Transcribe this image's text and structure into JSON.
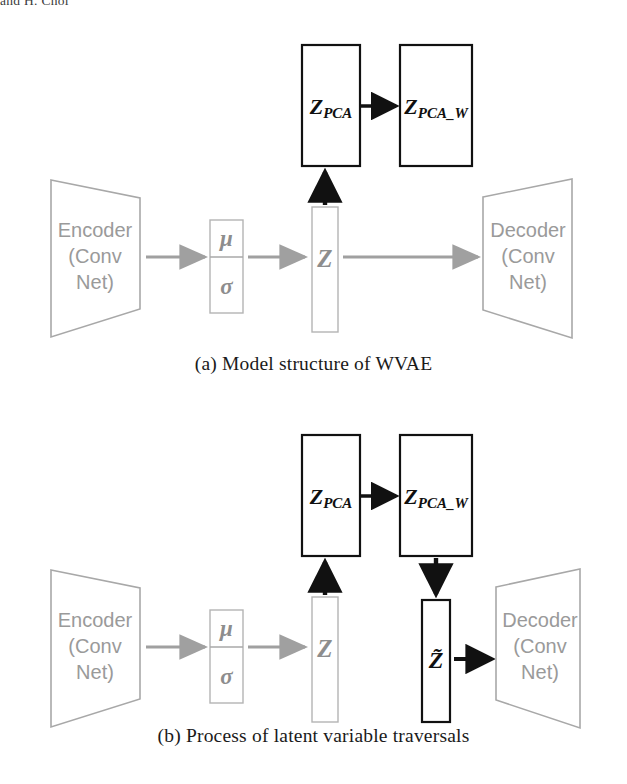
{
  "page": {
    "running_header": "and H. Choi"
  },
  "figures": [
    {
      "id": "fig-a",
      "caption": "(a) Model structure of WVAE",
      "nodes": {
        "encoder_line1": "Encoder",
        "encoder_line2": "(Conv",
        "encoder_line3": "Net)",
        "mu": "μ",
        "sigma": "σ",
        "z": "Z",
        "z_pca_main": "Z",
        "z_pca_sub": "PCA",
        "z_pca_w_main": "Z",
        "z_pca_w_sub": "PCA_W",
        "decoder_line1": "Decoder",
        "decoder_line2": "(Conv",
        "decoder_line3": "Net)"
      }
    },
    {
      "id": "fig-b",
      "caption": "(b) Process of latent variable traversals",
      "nodes": {
        "encoder_line1": "Encoder",
        "encoder_line2": "(Conv",
        "encoder_line3": "Net)",
        "mu": "μ",
        "sigma": "σ",
        "z": "Z",
        "z_pca_main": "Z",
        "z_pca_sub": "PCA",
        "z_pca_w_main": "Z",
        "z_pca_w_sub": "PCA_W",
        "z_tilde": "Z̃",
        "decoder_line1": "Decoder",
        "decoder_line2": "(Conv",
        "decoder_line3": "Net)"
      }
    }
  ],
  "colors": {
    "gray_stroke": "#a8a8a8",
    "gray_text": "#9a9a9a",
    "black_stroke": "#111111",
    "background": "#ffffff"
  }
}
